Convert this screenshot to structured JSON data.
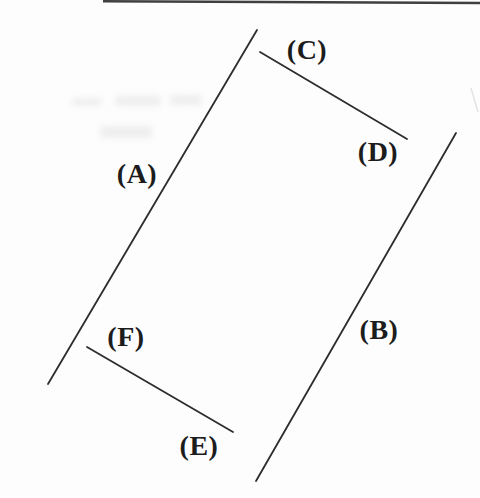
{
  "figure": {
    "labels": {
      "a": "(A)",
      "b": "(B)",
      "c": "(C)",
      "d": "(D)",
      "e": "(E)",
      "f": "(F)"
    },
    "segments": [
      {
        "name": "long-left-line",
        "label_refs": [
          "(A)"
        ]
      },
      {
        "name": "long-right-line",
        "label_refs": [
          "(B)"
        ]
      },
      {
        "name": "short-top-line",
        "label_refs": [
          "(C)",
          "(D)"
        ]
      },
      {
        "name": "short-bottom-line",
        "label_refs": [
          "(F)",
          "(E)"
        ]
      }
    ],
    "colors": {
      "ink": "#2d2d2d",
      "label_text": "#1c1c1c",
      "background": "#fdfdfd"
    }
  }
}
